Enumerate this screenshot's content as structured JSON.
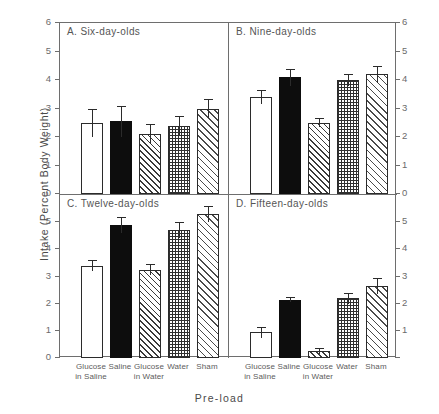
{
  "figure": {
    "ylabel": "Intake (Percent Body Weight)",
    "xlabel": "Pre-load"
  },
  "chart_data": {
    "type": "bar",
    "title": "",
    "xlabel": "Pre-load",
    "ylabel": "Intake (Percent Body Weight)",
    "ylim": [
      0,
      6
    ],
    "yticks": [
      "0",
      "1",
      "2",
      "3",
      "4",
      "5",
      "6"
    ],
    "grid": false,
    "legend": "none",
    "categories": [
      "Glucose in Saline",
      "Saline",
      "Glucose in Water",
      "Water",
      "Sham"
    ],
    "bar_styles": [
      "open",
      "solid-black",
      "diagonal-hatch",
      "cross-hatch",
      "diagonal-hatch-wide"
    ],
    "panels": [
      {
        "id": "A",
        "title": "A. Six-day-olds",
        "values": [
          2.5,
          2.55,
          2.1,
          2.4,
          3.0
        ],
        "errors": [
          0.5,
          0.55,
          0.35,
          0.35,
          0.35
        ]
      },
      {
        "id": "B",
        "title": "B. Nine-day-olds",
        "values": [
          3.4,
          4.1,
          2.5,
          4.0,
          4.2
        ],
        "errors": [
          0.25,
          0.3,
          0.15,
          0.2,
          0.3
        ]
      },
      {
        "id": "C",
        "title": "C. Twelve-day-olds",
        "values": [
          3.4,
          4.9,
          3.25,
          4.7,
          5.3
        ],
        "errors": [
          0.2,
          0.3,
          0.2,
          0.3,
          0.3
        ]
      },
      {
        "id": "D",
        "title": "D. Fifteen-day-olds",
        "values": [
          0.95,
          2.15,
          0.25,
          2.2,
          2.65
        ],
        "errors": [
          0.2,
          0.1,
          0.1,
          0.2,
          0.3
        ]
      }
    ]
  },
  "axes": {
    "left_top_ticks": [
      "6",
      "5",
      "4",
      "3",
      "2",
      "1",
      "0"
    ],
    "left_bottom_ticks": [
      "5",
      "4",
      "3",
      "2",
      "1",
      "0"
    ],
    "right_top_ticks": [
      "6",
      "5",
      "4",
      "3",
      "2",
      "1",
      "0"
    ],
    "right_bottom_ticks": [
      "5",
      "4",
      "3",
      "2",
      "1"
    ]
  },
  "xticklabels": {
    "left": [
      {
        "line1": "Glucose",
        "line2": "in Saline"
      },
      {
        "line1": "Saline",
        "line2": ""
      },
      {
        "line1": "Glucose",
        "line2": "in Water"
      },
      {
        "line1": "Water",
        "line2": ""
      },
      {
        "line1": "Sham",
        "line2": ""
      }
    ],
    "right": [
      {
        "line1": "Glucose",
        "line2": "in Saline"
      },
      {
        "line1": "Saline",
        "line2": ""
      },
      {
        "line1": "Glucose",
        "line2": "in Water"
      },
      {
        "line1": "Water",
        "line2": ""
      },
      {
        "line1": "Sham",
        "line2": ""
      }
    ]
  }
}
